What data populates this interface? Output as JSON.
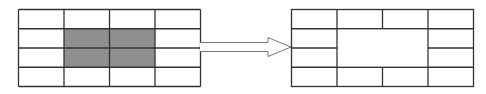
{
  "diagram": {
    "colors": {
      "line": "#333333",
      "shade": "#8f8f8f",
      "arrow": "#777777",
      "background": "#ffffff"
    },
    "before_grid": {
      "rows": 4,
      "cols": 4,
      "x": 18.5,
      "y": 9.5,
      "width": 182,
      "height": 77,
      "shaded_cells": [
        [
          1,
          1
        ],
        [
          1,
          2
        ],
        [
          2,
          1
        ],
        [
          2,
          2
        ]
      ]
    },
    "after_grid": {
      "rows": 4,
      "cols": 4,
      "x": 291.5,
      "y": 9.5,
      "width": 182,
      "height": 77,
      "merged_region": {
        "row": 1,
        "col": 1,
        "rowspan": 2,
        "colspan": 2
      }
    },
    "arrow": {
      "direction": "right",
      "from_x": 200,
      "to_x": 291,
      "center_y": 47
    }
  }
}
